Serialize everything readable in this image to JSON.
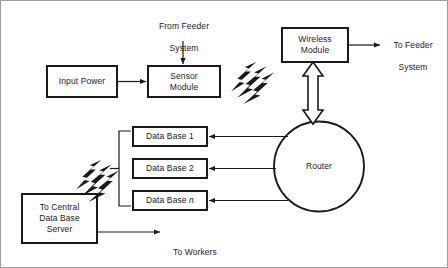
{
  "diagram": {
    "stroke_color": "#1a1a1a",
    "fill_color": "#ffffff",
    "border_color": "#9a9a9a",
    "nodes": [
      {
        "id": "input-power",
        "label": "Input Power",
        "shape": "rect"
      },
      {
        "id": "sensor-module",
        "label": "Sensor\nModule",
        "shape": "rect"
      },
      {
        "id": "wireless-module",
        "label": "Wireless\nModule",
        "shape": "rect"
      },
      {
        "id": "router",
        "label": "Router",
        "shape": "circle"
      },
      {
        "id": "data-base-1",
        "label": "Data Base 1",
        "shape": "rect"
      },
      {
        "id": "data-base-2",
        "label": "Data Base 2",
        "shape": "rect"
      },
      {
        "id": "data-base-n",
        "label": "Data Base n",
        "shape": "rect"
      },
      {
        "id": "central-db-server",
        "label": "To Central\nData Base\nServer",
        "shape": "rect"
      }
    ],
    "annotations": [
      {
        "id": "from-feeder-system",
        "label": "From Feeder\nSystem"
      },
      {
        "id": "to-feeder-system",
        "label": "To Feeder\nSystem"
      },
      {
        "id": "to-workers",
        "label": "To Workers"
      }
    ],
    "icons": [
      {
        "id": "wireless-signal-upper",
        "name": "wireless-signal-icon"
      },
      {
        "id": "wireless-signal-lower",
        "name": "wireless-signal-icon"
      }
    ],
    "connections": [
      {
        "from": "input-power",
        "to": "sensor-module",
        "style": "arrow"
      },
      {
        "from": "from-feeder-system",
        "to": "sensor-module",
        "style": "arrow"
      },
      {
        "from": "wireless-module",
        "to": "to-feeder-system",
        "style": "arrow"
      },
      {
        "from": "wireless-module",
        "to": "router",
        "style": "double-arrow-hollow"
      },
      {
        "from": "router",
        "to": "data-base-1",
        "style": "arrow"
      },
      {
        "from": "router",
        "to": "data-base-2",
        "style": "arrow"
      },
      {
        "from": "router",
        "to": "data-base-n",
        "style": "arrow"
      },
      {
        "from": "data-base-bus",
        "to": "wireless-signal-lower",
        "style": "line"
      },
      {
        "from": "central-db-server",
        "to": "to-workers",
        "style": "arrow"
      }
    ]
  },
  "labels": {
    "input_power": "Input Power",
    "sensor_module_line1": "Sensor",
    "sensor_module_line2": "Module",
    "wireless_module_line1": "Wireless",
    "wireless_module_line2": "Module",
    "router": "Router",
    "data_base_1": "Data Base 1",
    "data_base_2": "Data Base 2",
    "data_base_n_prefix": "Data Base ",
    "data_base_n_index": "n",
    "central_line1": "To Central",
    "central_line2": "Data Base",
    "central_line3": "Server",
    "from_feeder_line1": "From Feeder",
    "from_feeder_line2": "System",
    "to_feeder_line1": "To Feeder",
    "to_feeder_line2": "System",
    "to_workers": "To Workers"
  }
}
